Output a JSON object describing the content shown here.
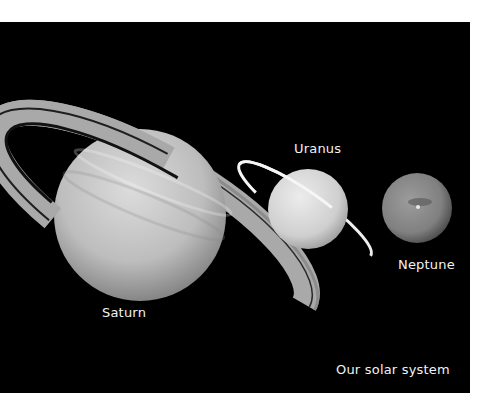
{
  "image": {
    "background": "#000000",
    "frame_color": "#ffffff",
    "caption": "Our solar system"
  },
  "planets": [
    {
      "name": "Saturn",
      "label": "Saturn",
      "has_rings": true,
      "tone": "#c9c9c9"
    },
    {
      "name": "Uranus",
      "label": "Uranus",
      "has_rings": true,
      "tone": "#d8d8d8"
    },
    {
      "name": "Neptune",
      "label": "Neptune",
      "has_rings": false,
      "tone": "#8a8a8a"
    }
  ]
}
